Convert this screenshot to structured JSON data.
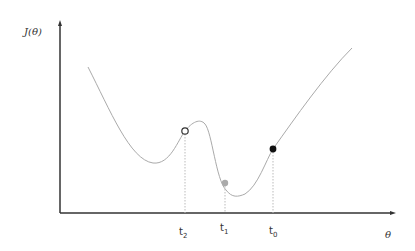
{
  "diagram": {
    "y_axis_label": "J(θ)",
    "x_axis_label": "θ",
    "ticks": [
      {
        "base": "t",
        "sub": "2",
        "x": 185
      },
      {
        "base": "t",
        "sub": "1",
        "x": 225
      },
      {
        "base": "t",
        "sub": "0",
        "x": 273
      }
    ],
    "points": [
      {
        "name": "t2",
        "style": "open",
        "x": 185,
        "y": 131,
        "color": "#333333"
      },
      {
        "name": "t1",
        "style": "grey",
        "x": 225,
        "y": 183,
        "color": "#aaaaaa"
      },
      {
        "name": "t0",
        "style": "filled",
        "x": 273,
        "y": 149,
        "color": "#111111"
      }
    ],
    "colors": {
      "axis": "#333333",
      "curve": "#aaaaaa",
      "guide": "#bbbbbb"
    }
  }
}
